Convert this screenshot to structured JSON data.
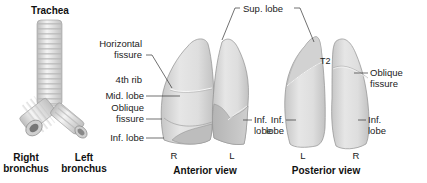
{
  "figure": {
    "trachea": {
      "title": "Trachea",
      "right_bronchus": [
        "Right",
        "bronchus"
      ],
      "left_bronchus": [
        "Left",
        "bronchus"
      ]
    },
    "anterior_view": {
      "title": "Anterior view",
      "side_labels": [
        "R",
        "L"
      ],
      "labels": {
        "horizontal_fissure": [
          "Horizontal",
          "fissure"
        ],
        "fourth_rib": "4th rib",
        "mid_lobe": "Mid. lobe",
        "oblique_fissure": [
          "Oblique",
          "fissure"
        ],
        "inf_lobe_right": "Inf. lobe",
        "inf_lobe_left": [
          "Inf.",
          "lobe"
        ]
      }
    },
    "shared": {
      "sup_lobe": "Sup. lobe"
    },
    "posterior_view": {
      "title": "Posterior view",
      "side_labels": [
        "L",
        "R"
      ],
      "labels": {
        "t2": "T2",
        "oblique_fissure": [
          "Oblique",
          "fissure"
        ],
        "inf_lobe_left": [
          "Inf.",
          "lobe"
        ],
        "inf_lobe_right": [
          "Inf.",
          "lobe"
        ]
      }
    },
    "colors": {
      "lung_fill": "#dcdcdc",
      "lung_shadow": "#b8b8b8",
      "lung_highlight": "#efefef",
      "outline": "#8a8a8a",
      "leader_line": "#333333",
      "trachea_ring_light": "#f2f2f2",
      "trachea_ring_dark": "#c4c4c4"
    }
  }
}
